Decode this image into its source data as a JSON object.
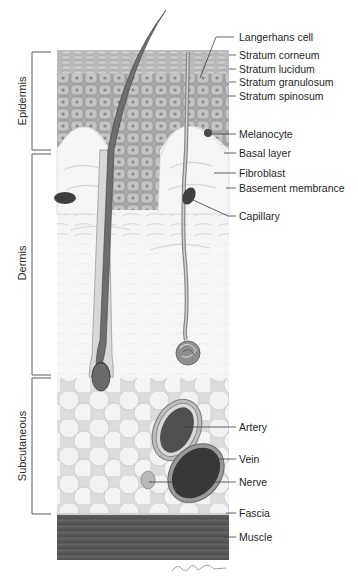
{
  "figure": {
    "style": "grayscale anatomical illustration"
  },
  "regions": [
    {
      "id": "epidermis",
      "label": "Epidermis",
      "y_top": 52,
      "y_bottom": 151
    },
    {
      "id": "dermis",
      "label": "Dermis",
      "y_top": 154,
      "y_bottom": 375
    },
    {
      "id": "subcutaneous",
      "label": "Subcutaneous",
      "y_top": 378,
      "y_bottom": 514
    }
  ],
  "labels": [
    {
      "id": "langerhans-cell",
      "text": "Langerhans cell",
      "y": 37
    },
    {
      "id": "stratum-corneum",
      "text": "Stratum corneum",
      "y": 55
    },
    {
      "id": "stratum-lucidum",
      "text": "Stratum lucidum",
      "y": 69
    },
    {
      "id": "stratum-granulosum",
      "text": "Stratum granulosum",
      "y": 82
    },
    {
      "id": "stratum-spinosum",
      "text": "Stratum spinosum",
      "y": 96
    },
    {
      "id": "melanocyte",
      "text": "Melanocyte",
      "y": 134
    },
    {
      "id": "basal-layer",
      "text": "Basal layer",
      "y": 153
    },
    {
      "id": "fibroblast",
      "text": "Fibroblast",
      "y": 173
    },
    {
      "id": "basement-membrane",
      "text": "Basement membrance",
      "y": 188
    },
    {
      "id": "capillary",
      "text": "Capillary",
      "y": 216
    },
    {
      "id": "artery",
      "text": "Artery",
      "y": 427
    },
    {
      "id": "vein",
      "text": "Vein",
      "y": 459
    },
    {
      "id": "nerve",
      "text": "Nerve",
      "y": 482
    },
    {
      "id": "fascia",
      "text": "Fascia",
      "y": 513
    },
    {
      "id": "muscle",
      "text": "Muscle",
      "y": 537
    }
  ],
  "colors": {
    "epidermis": "#a8a8a8",
    "dermis": "#f3f3f3",
    "fat": "#e8e8e8",
    "muscle": "#585858",
    "vessel_dark": "#3a3a3a",
    "line": "#444444"
  }
}
